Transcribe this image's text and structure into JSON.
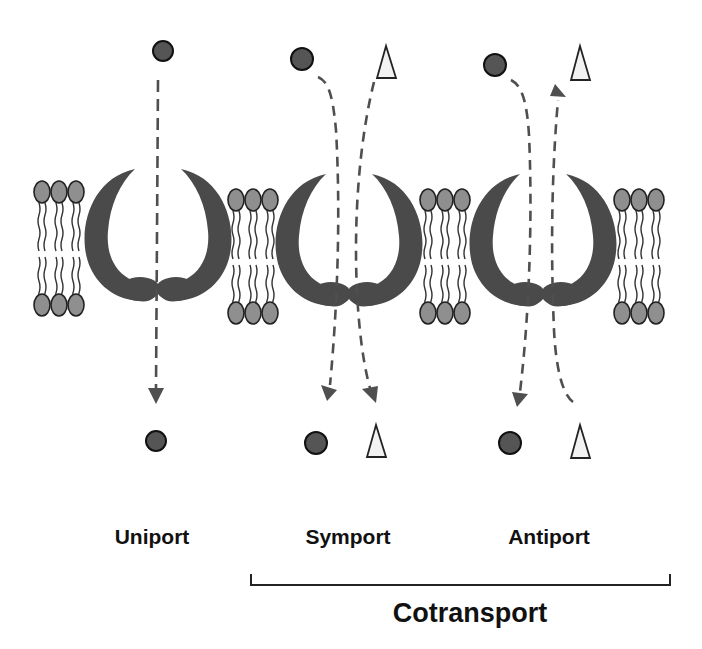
{
  "colors": {
    "protein": "#4a4a4a",
    "lipid_head": "#8f8f8f",
    "lipid_head_stroke": "#222222",
    "arrow": "#4f4f4f",
    "molecule_circle": "#555555",
    "molecule_triangle": "#f2f2f2",
    "text": "#111111"
  },
  "legend": {
    "circle": "molecule-circle-icon",
    "triangle": "molecule-triangle-icon"
  },
  "transporters": [
    {
      "id": "uniport",
      "label": "Uniport",
      "center_x": 158,
      "flows": [
        {
          "molecule": "circle",
          "direction": "down"
        }
      ]
    },
    {
      "id": "symport",
      "label": "Symport",
      "center_x": 349,
      "flows": [
        {
          "molecule": "circle",
          "direction": "down"
        },
        {
          "molecule": "triangle",
          "direction": "down"
        }
      ]
    },
    {
      "id": "antiport",
      "label": "Antiport",
      "center_x": 543,
      "flows": [
        {
          "molecule": "circle",
          "direction": "down"
        },
        {
          "molecule": "triangle",
          "direction": "up"
        }
      ]
    }
  ],
  "group": {
    "label": "Cotransport",
    "includes": [
      "symport",
      "antiport"
    ]
  },
  "labels": {
    "uniport": "Uniport",
    "symport": "Symport",
    "antiport": "Antiport",
    "cotransport": "Cotransport"
  }
}
